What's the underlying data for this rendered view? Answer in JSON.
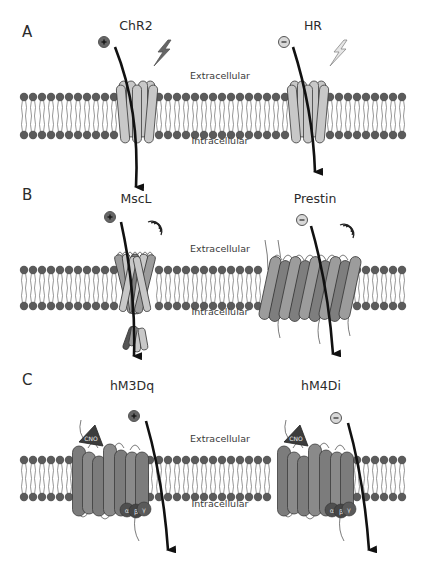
{
  "figure": {
    "colors": {
      "lipid_head": "#5b5b5b",
      "lipid_tail": "#6a6a6a",
      "light_protein": "#c8c8c8",
      "mid_protein": "#9c9c9c",
      "dark_protein": "#7e7e7e",
      "outline": "#3a3a3a",
      "arrow": "#111111",
      "cno": "#3c3c3c",
      "gprotein": "#4a4a4a"
    },
    "membrane": {
      "x_start": 24,
      "x_end": 408,
      "spacing": 9,
      "head_r": 4.2
    },
    "panels": [
      {
        "letter": "A",
        "letter_pos": [
          22,
          33
        ],
        "membrane_top": 97,
        "membrane_bottom": 135,
        "region_labels": {
          "extracellular": "Extracellular",
          "intracellular": "Intracellular",
          "x": 220,
          "ext_y": 76,
          "int_y": 141
        },
        "proteins": [
          {
            "name": "ChR2",
            "name_pos": [
              136,
              26
            ],
            "type": "opsin",
            "fill": "light",
            "cx": 137,
            "ion": "+",
            "ion_pos": [
              104,
              42
            ],
            "stimulus": "light-bolt-dark",
            "stim_pos": [
              160,
              48
            ],
            "arrow": [
              [
                115,
                47
              ],
              [
                140,
                110
              ],
              [
                136,
                187
              ]
            ]
          },
          {
            "name": "HR",
            "name_pos": [
              313,
              26
            ],
            "type": "opsin",
            "fill": "light",
            "cx": 308,
            "ion": "-",
            "ion_pos": [
              284,
              42
            ],
            "stimulus": "light-bolt-pale",
            "stim_pos": [
              336,
              48
            ],
            "arrow": [
              [
                293,
                47
              ],
              [
                313,
                110
              ],
              [
                315,
                172
              ]
            ]
          }
        ]
      },
      {
        "letter": "B",
        "letter_pos": [
          22,
          196
        ],
        "membrane_top": 270,
        "membrane_bottom": 306,
        "region_labels": {
          "extracellular": "Extracellular",
          "intracellular": "Intracellular",
          "x": 220,
          "ext_y": 249,
          "int_y": 312
        },
        "proteins": [
          {
            "name": "MscL",
            "name_pos": [
              136,
              199
            ],
            "type": "mscl",
            "cx": 135,
            "ion": "+",
            "ion_pos": [
              110,
              217
            ],
            "stimulus": "sound-waves",
            "stim_pos": [
              158,
              225
            ],
            "arrow": [
              [
                121,
                222
              ],
              [
                136,
                290
              ],
              [
                134,
                356
              ]
            ]
          },
          {
            "name": "Prestin",
            "name_pos": [
              315,
              199
            ],
            "type": "prestin",
            "cx": 310,
            "ion": "-",
            "ion_pos": [
              302,
              220
            ],
            "stimulus": "sound-waves",
            "stim_pos": [
              350,
              228
            ],
            "arrow": [
              [
                311,
                226
              ],
              [
                328,
                285
              ],
              [
                333,
                354
              ]
            ]
          }
        ]
      },
      {
        "letter": "C",
        "letter_pos": [
          22,
          381
        ],
        "membrane_top": 460,
        "membrane_bottom": 497,
        "region_labels": {
          "extracellular": "Extracellular",
          "intracellular": "Intracellular",
          "x": 220,
          "ext_y": 439,
          "int_y": 504
        },
        "proteins": [
          {
            "name": "hM3Dq",
            "name_pos": [
              132,
              386
            ],
            "type": "dreadd",
            "cx": 107,
            "left": 73,
            "ion": "+",
            "ion_pos": [
              134,
              416
            ],
            "stimulus": "cno",
            "arrow": [
              [
                146,
                421
              ],
              [
                163,
                480
              ],
              [
                168,
                550
              ]
            ],
            "gprotein": [
              "α",
              "β",
              "γ"
            ]
          },
          {
            "name": "hM4Di",
            "name_pos": [
              321,
              386
            ],
            "type": "dreadd",
            "cx": 293,
            "left": 278,
            "ion": "-",
            "ion_pos": [
              336,
              418
            ],
            "stimulus": "cno",
            "arrow": [
              [
                348,
                423
              ],
              [
                364,
                480
              ],
              [
                369,
                550
              ]
            ],
            "gprotein": [
              "α",
              "β",
              "γ"
            ]
          }
        ]
      }
    ],
    "ligand_label": "CNO"
  }
}
